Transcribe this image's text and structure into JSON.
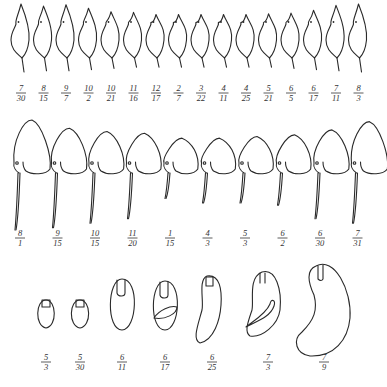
{
  "rows": [
    {
      "name": "row-1-helmeted-forms",
      "shape": "helmet-slender",
      "figures": [
        {
          "num": "7",
          "den": "30",
          "crest": 1.0,
          "tail": 1.0
        },
        {
          "num": "8",
          "den": "15",
          "crest": 0.85,
          "tail": 0.9
        },
        {
          "num": "9",
          "den": "7",
          "crest": 0.95,
          "tail": 0.9
        },
        {
          "num": "10",
          "den": "2",
          "crest": 0.7,
          "tail": 0.8
        },
        {
          "num": "10",
          "den": "21",
          "crest": 0.45,
          "tail": 0.7
        },
        {
          "num": "11",
          "den": "16",
          "crest": 0.4,
          "tail": 0.6
        },
        {
          "num": "12",
          "den": "17",
          "crest": 0.25,
          "tail": 0.6
        },
        {
          "num": "2",
          "den": "7",
          "crest": 0.25,
          "tail": 0.6
        },
        {
          "num": "3",
          "den": "22",
          "crest": 0.25,
          "tail": 0.6
        },
        {
          "num": "4",
          "den": "11",
          "crest": 0.25,
          "tail": 0.6
        },
        {
          "num": "4",
          "den": "25",
          "crest": 0.25,
          "tail": 0.6
        },
        {
          "num": "5",
          "den": "21",
          "crest": 0.3,
          "tail": 0.6
        },
        {
          "num": "6",
          "den": "5",
          "crest": 0.35,
          "tail": 0.7
        },
        {
          "num": "6",
          "den": "17",
          "crest": 0.55,
          "tail": 0.8
        },
        {
          "num": "7",
          "den": "11",
          "crest": 0.9,
          "tail": 0.9
        },
        {
          "num": "8",
          "den": "3",
          "crest": 1.0,
          "tail": 1.0
        }
      ]
    },
    {
      "name": "row-2-spined-forms",
      "shape": "dome-with-spine",
      "figures": [
        {
          "num": "8",
          "den": "1",
          "dome": 1.0,
          "spine": 1.0
        },
        {
          "num": "9",
          "den": "15",
          "dome": 0.75,
          "spine": 0.95
        },
        {
          "num": "10",
          "den": "15",
          "dome": 0.65,
          "spine": 0.85
        },
        {
          "num": "11",
          "den": "20",
          "dome": 0.6,
          "spine": 0.75
        },
        {
          "num": "1",
          "den": "15",
          "dome": 0.45,
          "spine": 0.3
        },
        {
          "num": "4",
          "den": "3",
          "dome": 0.45,
          "spine": 0.4
        },
        {
          "num": "5",
          "den": "3",
          "dome": 0.5,
          "spine": 0.4
        },
        {
          "num": "6",
          "den": "2",
          "dome": 0.55,
          "spine": 0.45
        },
        {
          "num": "6",
          "den": "30",
          "dome": 0.7,
          "spine": 0.75
        },
        {
          "num": "7",
          "den": "31",
          "dome": 0.95,
          "spine": 0.85
        }
      ]
    },
    {
      "name": "row-3-ovoid-forms",
      "shape": "ovoid-developing",
      "figures": [
        {
          "num": "5",
          "den": "3",
          "stage": 1
        },
        {
          "num": "5",
          "den": "30",
          "stage": 2
        },
        {
          "num": "6",
          "den": "11",
          "stage": 3
        },
        {
          "num": "6",
          "den": "17",
          "stage": 4
        },
        {
          "num": "6",
          "den": "25",
          "stage": 5
        },
        {
          "num": "7",
          "den": "3",
          "stage": 6
        },
        {
          "num": "7",
          "den": "9",
          "stage": 7
        }
      ]
    }
  ]
}
